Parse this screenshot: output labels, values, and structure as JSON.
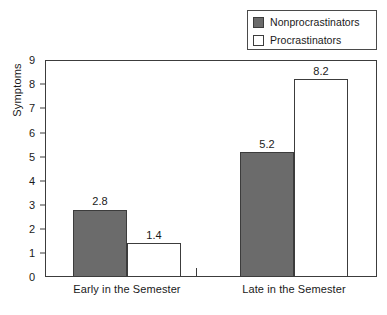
{
  "chart_data": {
    "type": "bar",
    "title": "",
    "xlabel": "",
    "ylabel": "Symptoms",
    "categories": [
      "Early in the Semester",
      "Late in the Semester"
    ],
    "series": [
      {
        "name": "Nonprocrastinators",
        "values": [
          2.8,
          5.2
        ],
        "color": "#6b6b6b",
        "fill": "solid"
      },
      {
        "name": "Procrastinators",
        "values": [
          1.4,
          8.2
        ],
        "color": "#ffffff",
        "fill": "hollow"
      }
    ],
    "ylim": [
      0,
      9
    ],
    "yticks": [
      0,
      1,
      2,
      3,
      4,
      5,
      6,
      7,
      8,
      9
    ],
    "ytick_labels": [
      "0",
      "1",
      "2",
      "3",
      "4",
      "5",
      "6",
      "7",
      "8",
      "9"
    ],
    "grid": false,
    "legend_position": "top-right",
    "data_labels": [
      "2.8",
      "1.4",
      "5.2",
      "8.2"
    ],
    "value_labels": {
      "early_nonprocrastinators": "2.8",
      "early_procrastinators": "1.4",
      "late_nonprocrastinators": "5.2",
      "late_procrastinators": "8.2"
    }
  },
  "legend": {
    "items": [
      {
        "label": "Nonprocrastinators",
        "swatch": "filled-square-icon"
      },
      {
        "label": "Procrastinators",
        "swatch": "hollow-square-icon"
      }
    ]
  },
  "axes": {
    "y_title": "Symptoms",
    "y_tick_labels": [
      "9",
      "8",
      "7",
      "6",
      "5",
      "4",
      "3",
      "2",
      "1",
      "0"
    ],
    "x_tick_labels": [
      "Early in the Semester",
      "Late in the Semester"
    ]
  },
  "colors": {
    "bar_dark": "#6b6b6b",
    "bar_light": "#ffffff",
    "axis": "#3c3c3c",
    "text": "#1a1a1a",
    "background": "#ffffff"
  }
}
